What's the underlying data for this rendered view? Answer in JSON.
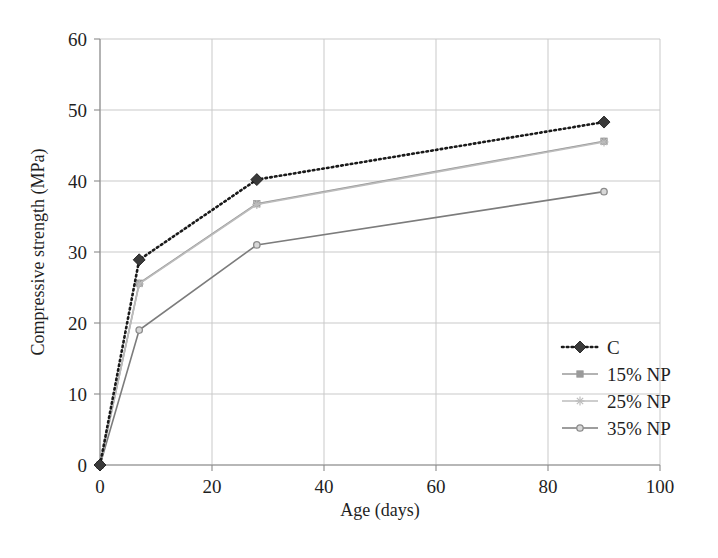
{
  "chart_data": {
    "type": "line",
    "title": "",
    "xlabel": "Age (days)",
    "ylabel": "Compressive strength (MPa)",
    "xlim": [
      0,
      100
    ],
    "ylim": [
      0,
      60
    ],
    "xticks": [
      0,
      20,
      40,
      60,
      80,
      100
    ],
    "yticks": [
      0,
      10,
      20,
      30,
      40,
      50,
      60
    ],
    "xtick_labels": [
      "0",
      "20",
      "40",
      "60",
      "80",
      "100"
    ],
    "ytick_labels": [
      "0",
      "10",
      "20",
      "30",
      "40",
      "50",
      "60"
    ],
    "grid": true,
    "legend_position": "right-middle",
    "x": [
      0,
      7,
      28,
      90
    ],
    "series": [
      {
        "name": "C",
        "values": [
          0,
          28.9,
          40.2,
          48.3
        ],
        "color": "#1a1a1a",
        "line_style": "dotted",
        "marker": "diamond",
        "marker_color": "#3a3a3a"
      },
      {
        "name": "15% NP",
        "values": [
          0,
          25.6,
          36.8,
          45.6
        ],
        "color": "#9a9a9a",
        "line_style": "solid",
        "marker": "square",
        "marker_color": "#9a9a9a"
      },
      {
        "name": "25% NP",
        "values": [
          0,
          25.5,
          36.7,
          45.5
        ],
        "color": "#bcbcbc",
        "line_style": "solid",
        "marker": "star",
        "marker_color": "#bcbcbc"
      },
      {
        "name": "35% NP",
        "values": [
          0,
          19.0,
          31.0,
          38.5
        ],
        "color": "#7c7c7c",
        "line_style": "solid",
        "marker": "circle",
        "marker_color": "#8c8c8c"
      }
    ]
  },
  "legend": {
    "items": [
      {
        "label": "C"
      },
      {
        "label": "15% NP"
      },
      {
        "label": "25% NP"
      },
      {
        "label": "35% NP"
      }
    ]
  },
  "axes": {
    "x_title": "Age (days)",
    "y_title": "Compressive strength (MPa)"
  }
}
